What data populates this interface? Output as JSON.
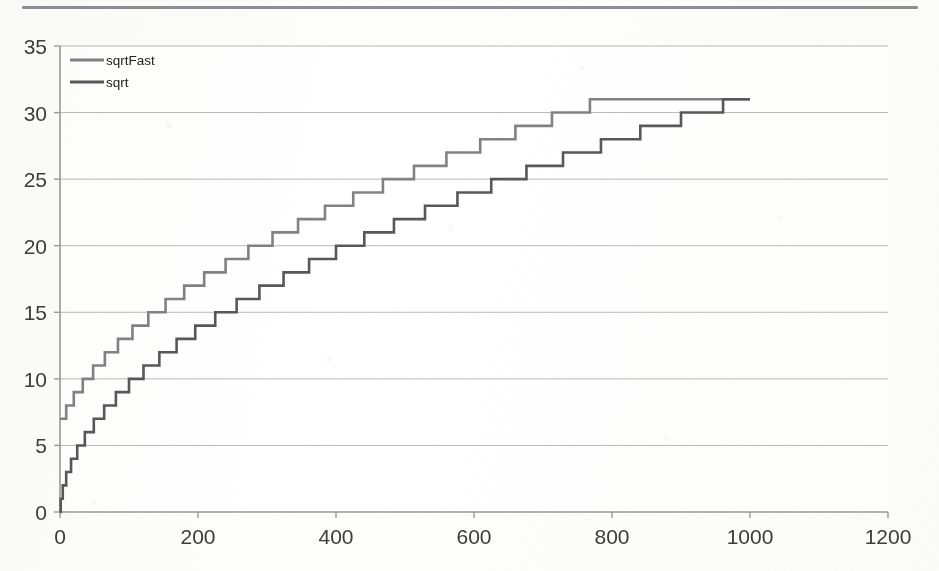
{
  "page": {
    "top_rule": "horizontal-divider"
  },
  "chart_data": {
    "type": "line",
    "title": "",
    "subtitle": "",
    "xlabel": "",
    "ylabel": "",
    "xlim": [
      0,
      1200
    ],
    "ylim": [
      0,
      35
    ],
    "xticks": [
      0,
      200,
      400,
      600,
      800,
      1000,
      1200
    ],
    "yticks": [
      0,
      5,
      10,
      15,
      20,
      25,
      30,
      35
    ],
    "xtick_labels": [
      "0",
      "200",
      "400",
      "600",
      "800",
      "1000",
      "1200"
    ],
    "ytick_labels": [
      "0",
      "5",
      "10",
      "15",
      "20",
      "25",
      "30",
      "35"
    ],
    "grid": "horizontal",
    "legend_position": "top-left-inside",
    "step_style": "post",
    "annotations": [],
    "series": [
      {
        "name": "sqrtFast",
        "color": "#808285",
        "linewidth": 2.6,
        "points": [
          [
            0,
            7
          ],
          [
            1,
            7
          ],
          [
            9,
            8
          ],
          [
            20,
            9
          ],
          [
            33,
            10
          ],
          [
            48,
            11
          ],
          [
            65,
            12
          ],
          [
            84,
            13
          ],
          [
            105,
            14
          ],
          [
            128,
            15
          ],
          [
            153,
            16
          ],
          [
            180,
            17
          ],
          [
            209,
            18
          ],
          [
            240,
            19
          ],
          [
            273,
            20
          ],
          [
            308,
            21
          ],
          [
            345,
            22
          ],
          [
            384,
            23
          ],
          [
            425,
            24
          ],
          [
            468,
            25
          ],
          [
            513,
            26
          ],
          [
            560,
            27
          ],
          [
            609,
            28
          ],
          [
            660,
            29
          ],
          [
            713,
            30
          ],
          [
            768,
            31
          ],
          [
            1000,
            31
          ]
        ]
      },
      {
        "name": "sqrt",
        "color": "#58585a",
        "linewidth": 2.6,
        "points": [
          [
            0,
            0
          ],
          [
            1,
            1
          ],
          [
            4,
            2
          ],
          [
            9,
            3
          ],
          [
            16,
            4
          ],
          [
            25,
            5
          ],
          [
            36,
            6
          ],
          [
            49,
            7
          ],
          [
            64,
            8
          ],
          [
            81,
            9
          ],
          [
            100,
            10
          ],
          [
            121,
            11
          ],
          [
            144,
            12
          ],
          [
            169,
            13
          ],
          [
            196,
            14
          ],
          [
            225,
            15
          ],
          [
            256,
            16
          ],
          [
            289,
            17
          ],
          [
            324,
            18
          ],
          [
            361,
            19
          ],
          [
            400,
            20
          ],
          [
            441,
            21
          ],
          [
            484,
            22
          ],
          [
            529,
            23
          ],
          [
            576,
            24
          ],
          [
            625,
            25
          ],
          [
            676,
            26
          ],
          [
            729,
            27
          ],
          [
            784,
            28
          ],
          [
            841,
            29
          ],
          [
            900,
            30
          ],
          [
            961,
            31
          ],
          [
            1000,
            31
          ]
        ]
      }
    ],
    "axis_color": "#9a9a9a",
    "grid_color": "#b9b9b9",
    "background": "#ffffff"
  }
}
